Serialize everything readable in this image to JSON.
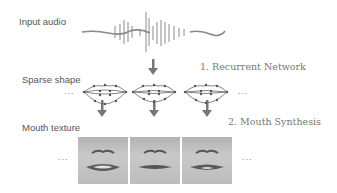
{
  "labels": {
    "input_audio": "Input audio",
    "sparse_shape": "Sparse shape",
    "mouth_texture": "Mouth texture"
  },
  "steps": {
    "step1": "1. Recurrent Network",
    "step2": "2. Mouth Synthesis"
  },
  "ellipsis": "...",
  "colors": {
    "arrow": "#777777",
    "text": "#555555",
    "wave": "#8a8a8a"
  }
}
